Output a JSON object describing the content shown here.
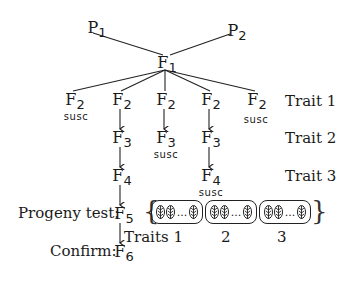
{
  "parents": {
    "p1": {
      "base": "P",
      "sub": "1"
    },
    "p2": {
      "base": "P",
      "sub": "2"
    }
  },
  "f1": {
    "base": "F",
    "sub": "1"
  },
  "f2_row": [
    {
      "base": "F",
      "sub": "2",
      "note": "susc"
    },
    {
      "base": "F",
      "sub": "2",
      "note": ""
    },
    {
      "base": "F",
      "sub": "2",
      "note": ""
    },
    {
      "base": "F",
      "sub": "2",
      "note": ""
    },
    {
      "base": "F",
      "sub": "2",
      "note": "susc"
    }
  ],
  "f3_row": [
    {
      "base": "F",
      "sub": "3",
      "note": ""
    },
    {
      "base": "F",
      "sub": "3",
      "note": "susc"
    },
    {
      "base": "F",
      "sub": "3",
      "note": ""
    }
  ],
  "f4_row": [
    {
      "base": "F",
      "sub": "4",
      "note": ""
    },
    {
      "base": "F",
      "sub": "4",
      "note": "susc"
    }
  ],
  "f5": {
    "base": "F",
    "sub": "5",
    "label": "Progeny test:"
  },
  "f6": {
    "base": "F",
    "sub": "6",
    "label": "Confirm:"
  },
  "traits": {
    "t1": "Trait 1",
    "t2": "Trait 2",
    "t3": "Trait 3"
  },
  "progeny_boxes": {
    "dots": "...",
    "labels": [
      "Traits 1",
      "2",
      "3"
    ]
  }
}
